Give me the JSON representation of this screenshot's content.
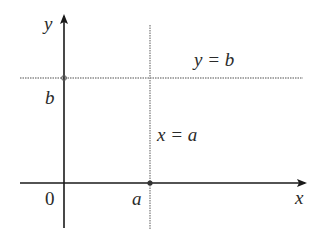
{
  "diagram": {
    "axes": {
      "x_label": "x",
      "y_label": "y",
      "origin_label": "0"
    },
    "lines": [
      {
        "name": "horizontal-line",
        "equation": "y = b",
        "style": "dotted"
      },
      {
        "name": "vertical-line",
        "equation": "x = a",
        "style": "dotted"
      }
    ],
    "tick_labels": {
      "x_intercept": "a",
      "y_intercept": "b"
    },
    "points": [
      {
        "label": "(a, 0)",
        "on": "x-axis"
      },
      {
        "label": "(0, b)",
        "on": "y-axis"
      }
    ],
    "colors": {
      "axis": "#1a1a1a",
      "dotted_line": "#8a8a8a",
      "text": "#2a2a2a"
    }
  }
}
